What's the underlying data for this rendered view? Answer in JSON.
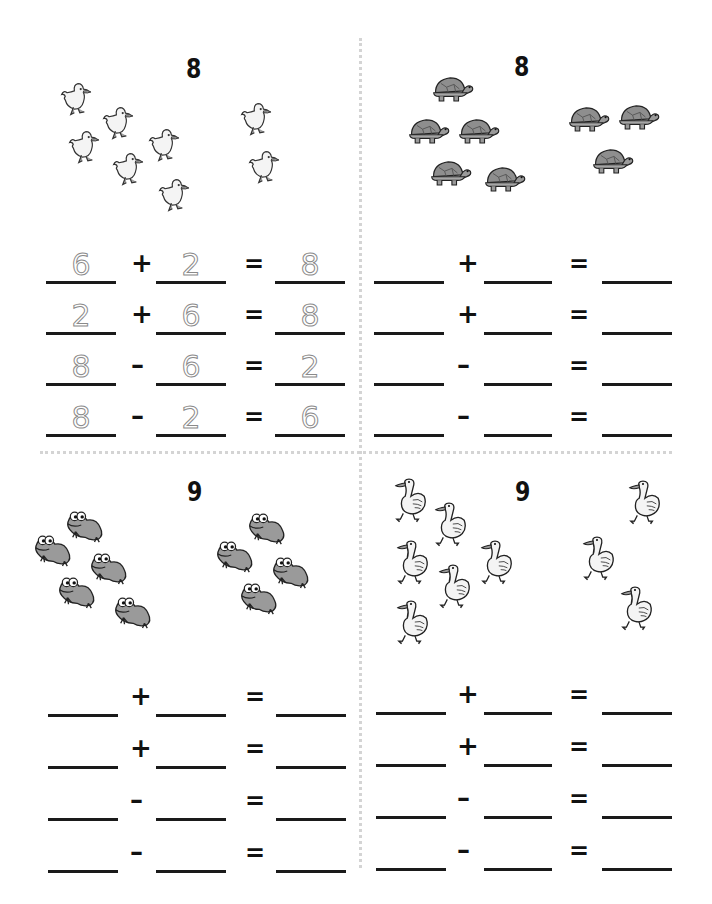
{
  "worksheet": {
    "quadrants": [
      {
        "id": "q1",
        "number": "8",
        "animal": "duck-chick",
        "group_left_count": 6,
        "group_right_count": 2,
        "equations": [
          {
            "a": "6",
            "op": "+",
            "b": "2",
            "eq": "=",
            "c": "8"
          },
          {
            "a": "2",
            "op": "+",
            "b": "6",
            "eq": "=",
            "c": "8"
          },
          {
            "a": "8",
            "op": "–",
            "b": "6",
            "eq": "=",
            "c": "2"
          },
          {
            "a": "8",
            "op": "–",
            "b": "2",
            "eq": "=",
            "c": "6"
          }
        ]
      },
      {
        "id": "q2",
        "number": "8",
        "animal": "turtle",
        "group_left_count": 5,
        "group_right_count": 3,
        "equations": [
          {
            "a": "",
            "op": "+",
            "b": "",
            "eq": "=",
            "c": ""
          },
          {
            "a": "",
            "op": "+",
            "b": "",
            "eq": "=",
            "c": ""
          },
          {
            "a": "",
            "op": "–",
            "b": "",
            "eq": "=",
            "c": ""
          },
          {
            "a": "",
            "op": "–",
            "b": "",
            "eq": "=",
            "c": ""
          }
        ]
      },
      {
        "id": "q3",
        "number": "9",
        "animal": "frog",
        "group_left_count": 5,
        "group_right_count": 4,
        "equations": [
          {
            "a": "",
            "op": "+",
            "b": "",
            "eq": "=",
            "c": ""
          },
          {
            "a": "",
            "op": "+",
            "b": "",
            "eq": "=",
            "c": ""
          },
          {
            "a": "",
            "op": "–",
            "b": "",
            "eq": "=",
            "c": ""
          },
          {
            "a": "",
            "op": "–",
            "b": "",
            "eq": "=",
            "c": ""
          }
        ]
      },
      {
        "id": "q4",
        "number": "9",
        "animal": "goose",
        "group_left_count": 6,
        "group_right_count": 3,
        "equations": [
          {
            "a": "",
            "op": "+",
            "b": "",
            "eq": "=",
            "c": ""
          },
          {
            "a": "",
            "op": "+",
            "b": "",
            "eq": "=",
            "c": ""
          },
          {
            "a": "",
            "op": "–",
            "b": "",
            "eq": "=",
            "c": ""
          },
          {
            "a": "",
            "op": "–",
            "b": "",
            "eq": "=",
            "c": ""
          }
        ]
      }
    ],
    "colors": {
      "ink": "#111111",
      "trace": "#8a8a8a",
      "animal_fill_light": "#f2f2f2",
      "animal_fill_dark": "#9a9a9a",
      "divider": "#d4d4d4"
    }
  }
}
